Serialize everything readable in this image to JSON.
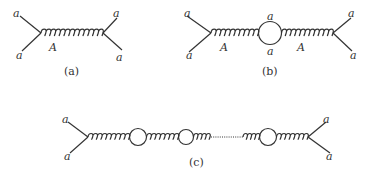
{
  "diagrams": {
    "a": {
      "caption": "(a)",
      "external_labels": [
        "a",
        "a",
        "a",
        "a"
      ],
      "propagator_label": "A"
    },
    "b": {
      "caption": "(b)",
      "external_labels": [
        "a",
        "a",
        "a",
        "a"
      ],
      "loop_labels": [
        "a",
        "a"
      ],
      "propagator_labels": [
        "A",
        "A"
      ]
    },
    "c": {
      "caption": "(c)",
      "external_labels": [
        "a",
        "a",
        "a",
        "a"
      ]
    }
  },
  "colors": {
    "line": "#333333",
    "background": "#ffffff"
  }
}
